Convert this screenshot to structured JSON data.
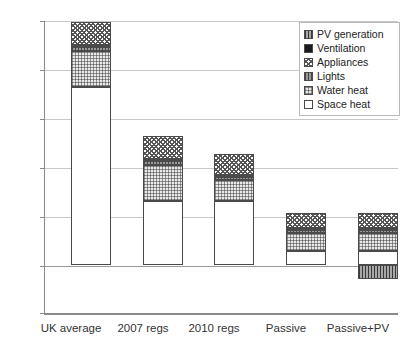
{
  "chart_data": {
    "type": "bar",
    "subtype": "stacked-bar",
    "title": "",
    "subtitle": "",
    "xlabel": "",
    "ylabel": "",
    "ylim": [
      -50,
      250
    ],
    "yticks": [
      -50,
      0,
      50,
      100,
      150,
      200,
      250
    ],
    "ytick_labels": [
      "-50",
      "0",
      "50",
      "100",
      "150",
      "200",
      "250"
    ],
    "grid": true,
    "grid_axis": "y",
    "legend_position": "top-right",
    "categories": [
      "UK average",
      "2007 regs",
      "2010 regs",
      "Passive",
      "Passive+PV"
    ],
    "series": [
      {
        "name": "Space heat",
        "pattern": "solid-white",
        "color": "#ffffff",
        "values": [
          182,
          66,
          66,
          15,
          15
        ]
      },
      {
        "name": "Water heat",
        "pattern": "fine-grid",
        "color": "#e9e9e9",
        "values": [
          37,
          37,
          21,
          18,
          18
        ]
      },
      {
        "name": "Lights",
        "pattern": "vertical-lines",
        "color": "#9a9a9a",
        "values": [
          4,
          4,
          3,
          3,
          3
        ]
      },
      {
        "name": "Ventilation",
        "pattern": "solid-black",
        "color": "#1b1b1b",
        "values": [
          2,
          2,
          2,
          2,
          2
        ]
      },
      {
        "name": "Appliances",
        "pattern": "cross-hatch",
        "color": "#ffffff",
        "values": [
          24,
          23,
          22,
          15,
          15
        ]
      },
      {
        "name": "PV generation",
        "pattern": "vertical-stipple",
        "color": "#a8a8a8",
        "values": [
          0,
          0,
          0,
          0,
          -14
        ]
      }
    ],
    "totals_positive": [
      249,
      132,
      114,
      53,
      53
    ],
    "totals_negative": [
      0,
      0,
      0,
      0,
      -14
    ],
    "legend_order": [
      "PV generation",
      "Ventilation",
      "Appliances",
      "Lights",
      "Water heat",
      "Space heat"
    ]
  },
  "axis": {
    "y_tick_labels": [
      "250",
      "200",
      "150",
      "100",
      "50",
      "0",
      "-50"
    ],
    "x_tick_labels": [
      "UK average",
      "2007 regs",
      "2010 regs",
      "Passive",
      "Passive+PV"
    ]
  },
  "legend": {
    "items": [
      {
        "label": "PV generation",
        "swatch": "vertical-stipple-swatch"
      },
      {
        "label": "Ventilation",
        "swatch": "solid-black-swatch"
      },
      {
        "label": "Appliances",
        "swatch": "cross-hatch-swatch"
      },
      {
        "label": "Lights",
        "swatch": "vertical-lines-swatch"
      },
      {
        "label": "Water heat",
        "swatch": "fine-grid-swatch"
      },
      {
        "label": "Space heat",
        "swatch": "solid-white-swatch"
      }
    ]
  },
  "style": {
    "axis_color": "#8a8a8a",
    "grid_color": "#c8c8c8",
    "bar_outline": "#4a4a4a",
    "text_color": "#333333",
    "background": "#ffffff"
  }
}
